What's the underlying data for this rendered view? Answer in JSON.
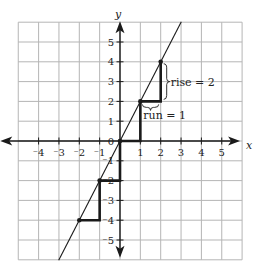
{
  "chart_data": {
    "type": "line",
    "title": "",
    "xlabel": "x",
    "ylabel": "y",
    "xlim": [
      -5,
      6
    ],
    "ylim": [
      -6,
      6
    ],
    "grid": true,
    "x_ticks": [
      -4,
      -3,
      -2,
      -1,
      1,
      2,
      3,
      4,
      5
    ],
    "y_ticks": [
      -5,
      -4,
      -3,
      -2,
      -1,
      0,
      1,
      2,
      3,
      4,
      5
    ],
    "x_tick_labels": [
      "⁻4",
      "⁻3",
      "⁻2",
      "⁻1",
      "1",
      "2",
      "3",
      "4",
      "5"
    ],
    "y_tick_labels": [
      "⁻5",
      "⁻4",
      "⁻3",
      "⁻2",
      "⁻1",
      "0",
      "1",
      "2",
      "3",
      "4",
      "5"
    ],
    "series": [
      {
        "name": "line y = 2x",
        "style": "thin",
        "x": [
          -3,
          3
        ],
        "y": [
          -6,
          6
        ]
      },
      {
        "name": "slope staircase",
        "style": "thick",
        "x": [
          -2,
          -1,
          -1,
          0,
          0,
          1,
          1,
          2,
          2
        ],
        "y": [
          -4,
          -4,
          -2,
          -2,
          0,
          0,
          2,
          2,
          4
        ]
      }
    ],
    "points": [
      {
        "x": -2,
        "y": -4
      },
      {
        "x": -1,
        "y": -2
      },
      {
        "x": 0,
        "y": 0
      },
      {
        "x": 1,
        "y": 2
      },
      {
        "x": 2,
        "y": 4
      }
    ],
    "annotations": [
      {
        "text": "rise = 2",
        "from": {
          "x": 2,
          "y": 2
        },
        "to": {
          "x": 2,
          "y": 4
        }
      },
      {
        "text": "run = 1",
        "from": {
          "x": 1,
          "y": 2
        },
        "to": {
          "x": 2,
          "y": 2
        }
      }
    ],
    "colors": {
      "grid": "#b5b5b5",
      "axis": "#1a1a1a",
      "line": "#1a1a1a"
    }
  }
}
